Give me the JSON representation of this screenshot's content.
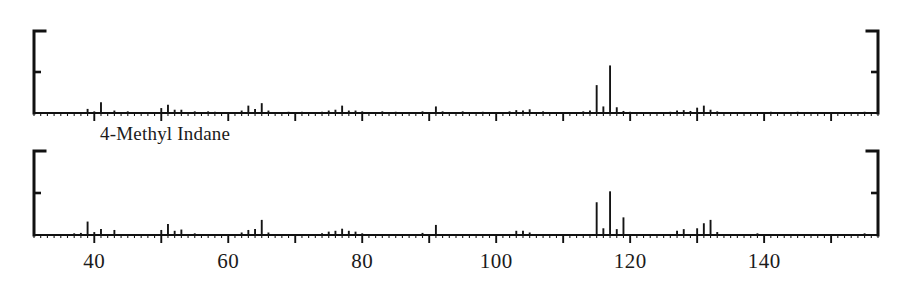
{
  "figure": {
    "title": "",
    "compound_label": "4-Methyl Indane",
    "compound_label_x": 100,
    "compound_label_y": 123,
    "background_color": "#ffffff",
    "trace_color": "#141414",
    "axis_color": "#111111"
  },
  "axis": {
    "x_min": 31,
    "x_max": 157,
    "x_tick_labels": [
      "40",
      "60",
      "80",
      "100",
      "120",
      "140"
    ],
    "x_tick_values": [
      40,
      60,
      80,
      100,
      120,
      140
    ],
    "x_major_step": 10,
    "x_minor_step": 1,
    "y_min": 0,
    "y_max": 100,
    "y_half_tick": 50,
    "y_tick_labels": [],
    "x_label": "",
    "y_label": "",
    "grid": false
  },
  "layout": {
    "plot_left_px": 34,
    "plot_right_px": 878,
    "top_panel": {
      "baseline_y": 113,
      "top_y": 31
    },
    "bottom_panel": {
      "baseline_y": 235,
      "top_y": 151
    }
  },
  "chart_data": [
    {
      "type": "bar",
      "name": "top-spectrum",
      "title": "",
      "subtitle": "Unknown / library mass spectrum (upper)",
      "xlabel": "",
      "ylabel": "Relative Abundance",
      "xlim": [
        31,
        157
      ],
      "ylim": [
        0,
        100
      ],
      "categories": [
        39,
        40,
        41,
        43,
        45,
        50,
        51,
        52,
        53,
        55,
        57,
        58,
        59,
        62,
        63,
        64,
        65,
        66,
        69,
        71,
        74,
        75,
        76,
        77,
        78,
        79,
        80,
        83,
        85,
        89,
        91,
        92,
        95,
        98,
        102,
        103,
        104,
        105,
        107,
        113,
        114,
        115,
        116,
        117,
        118,
        119,
        120,
        126,
        127,
        128,
        129,
        130,
        131,
        132,
        133,
        141,
        145,
        155
      ],
      "values": [
        5,
        2,
        13,
        3,
        2,
        6,
        10,
        4,
        4,
        2,
        2,
        1.5,
        1,
        3,
        9,
        5,
        12,
        3,
        1.5,
        1.5,
        1.5,
        3,
        4,
        9,
        3,
        3,
        2,
        2,
        1.5,
        2,
        8,
        2,
        2,
        1.5,
        2,
        3.5,
        3,
        4.5,
        2,
        2,
        3,
        34,
        8,
        58,
        7,
        2.5,
        1.5,
        1.5,
        3,
        3.5,
        2.5,
        6.5,
        9,
        4,
        2,
        1.5,
        1.5,
        1.5
      ]
    },
    {
      "type": "bar",
      "name": "bottom-spectrum",
      "title": "",
      "subtitle": "Reference mass spectrum of 4-Methyl Indane (lower)",
      "xlabel": "m/z",
      "ylabel": "Relative Abundance",
      "xlim": [
        31,
        157
      ],
      "ylim": [
        0,
        100
      ],
      "categories": [
        37,
        38,
        39,
        40,
        41,
        43,
        50,
        51,
        52,
        53,
        55,
        62,
        63,
        64,
        65,
        66,
        74,
        75,
        76,
        77,
        78,
        79,
        80,
        89,
        91,
        103,
        104,
        105,
        115,
        116,
        117,
        118,
        119,
        127,
        128,
        130,
        131,
        132,
        133,
        139,
        155
      ],
      "values": [
        2,
        2.5,
        16,
        3.5,
        7,
        6,
        6,
        13,
        5,
        6.5,
        2,
        3,
        6,
        7,
        18,
        3,
        2,
        4,
        5,
        7.5,
        5,
        4,
        2,
        2.5,
        12,
        5,
        5,
        3,
        39,
        8,
        52,
        7,
        21,
        5,
        7,
        8,
        14,
        18,
        3.5,
        2,
        2
      ]
    }
  ]
}
